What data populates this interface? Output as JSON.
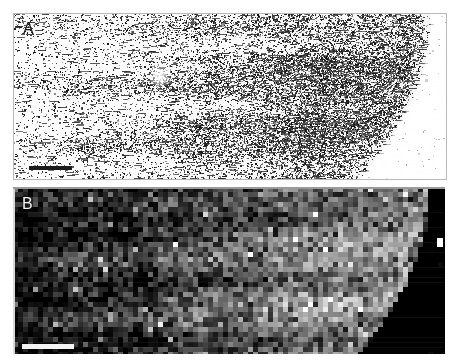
{
  "figure": {
    "type": "scientific-micrograph-figure",
    "background_color": "#ffffff",
    "width": 458,
    "height": 364,
    "panel_count": 2
  },
  "panels": [
    {
      "id": "A",
      "label": "A",
      "label_color": "#1a1a1a",
      "modality": "brightfield-autoradiograph",
      "description": "Light-field tissue section with dense dark silver-grain speckle labelling; labelling intensity increases toward the right/centre and a curved tissue border runs down the right side with pale background beyond it.",
      "background_color": "#fdfdfd",
      "speckle_color": "#1d1d1d",
      "border_color": "#b9b9b9",
      "bounds": {
        "x": 13,
        "y": 13,
        "width": 432,
        "height": 165
      },
      "scalebar": {
        "name": "scale-bar",
        "color": "#1b1b1b",
        "x": 15,
        "y": 152,
        "width": 43,
        "height": 4
      },
      "tissue_edge": {
        "present": true,
        "side": "right",
        "shape": "convex-curve",
        "apex_x_fraction": 0.96,
        "base_x_fraction": 0.85
      }
    },
    {
      "id": "B",
      "label": "B",
      "label_color": "#f2f2f2",
      "modality": "pseudocolour-density-map",
      "description": "Dark pixelated grayscale density / heat map of the same field; coarse blocky pixels of mid-grey on black, brighter band through the centre-right, solid black background to the right of the tissue edge.",
      "background_color": "#000000",
      "pixel_block_size": 5,
      "bounds": {
        "x": 13,
        "y": 187,
        "width": 432,
        "height": 167
      },
      "scalebar": {
        "name": "scale-bar",
        "color": "#f4f4f4",
        "x": 9,
        "y": 157,
        "width": 52,
        "height": 5
      },
      "marker": {
        "name": "bright-spot-marker",
        "color": "#ffffff",
        "x": 424,
        "y": 51,
        "width": 6,
        "height": 9
      },
      "tissue_edge": {
        "present": true,
        "side": "right",
        "shape": "convex-curve",
        "apex_x_fraction": 0.95,
        "base_x_fraction": 0.83
      }
    }
  ],
  "chart_data": {
    "type": "heatmap",
    "title": "",
    "xlabel": "",
    "ylabel": "",
    "grid": false,
    "legend": "none"
  }
}
